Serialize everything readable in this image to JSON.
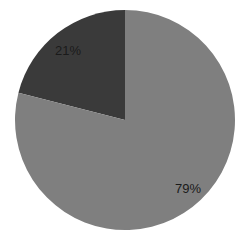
{
  "chart_data": {
    "type": "pie",
    "title": "",
    "categories": [
      "Slice A",
      "Slice B"
    ],
    "values": [
      21,
      79
    ],
    "labels": [
      "21%",
      "79%"
    ],
    "colors": [
      "#3a3a3a",
      "#7f7f7f"
    ],
    "start_angle_deg": 0,
    "direction": "counterclockwise-first-slice",
    "legend": false
  },
  "geometry": {
    "cx": 125,
    "cy": 120,
    "r": 110
  },
  "labels": {
    "slice_small": "21%",
    "slice_large": "79%"
  }
}
